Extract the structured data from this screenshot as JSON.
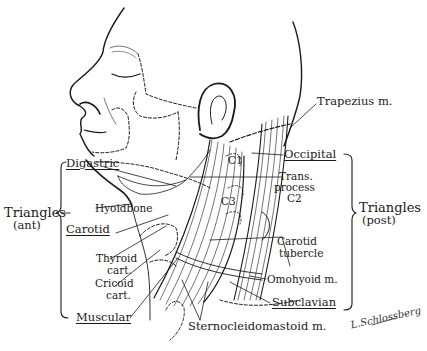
{
  "diagram": {
    "colors": {
      "ink": "#1a1a1a",
      "background": "#ffffff"
    },
    "groups": {
      "anterior": {
        "title": "Triangles",
        "subtitle": "(ant)"
      },
      "posterior": {
        "title": "Triangles",
        "subtitle": "(post)"
      }
    },
    "labels": {
      "digastric": "Digastric",
      "hyoid_bone": "Hyoidbone",
      "carotid": "Carotid",
      "thyroid_line1": "Thyroid",
      "thyroid_line2": "cart.",
      "cricoid_line1": "Cricoid",
      "cricoid_line2": "cart.",
      "muscular": "Muscular",
      "trapezius": "Trapezius m.",
      "occipital": "Occipital",
      "trans_line1": "Trans.",
      "trans_line2": "process",
      "trans_line3": "C2",
      "c1": "C1",
      "c3": "C3",
      "carotid_tubercle_line1": "Carotid",
      "carotid_tubercle_line2": "tubercle",
      "omohyoid": "Omohyoid m.",
      "subclavian": "Subclavian",
      "sternocleidomastoid": "Sternocleidomastoid m."
    },
    "signature": "L.Schlossberg"
  }
}
